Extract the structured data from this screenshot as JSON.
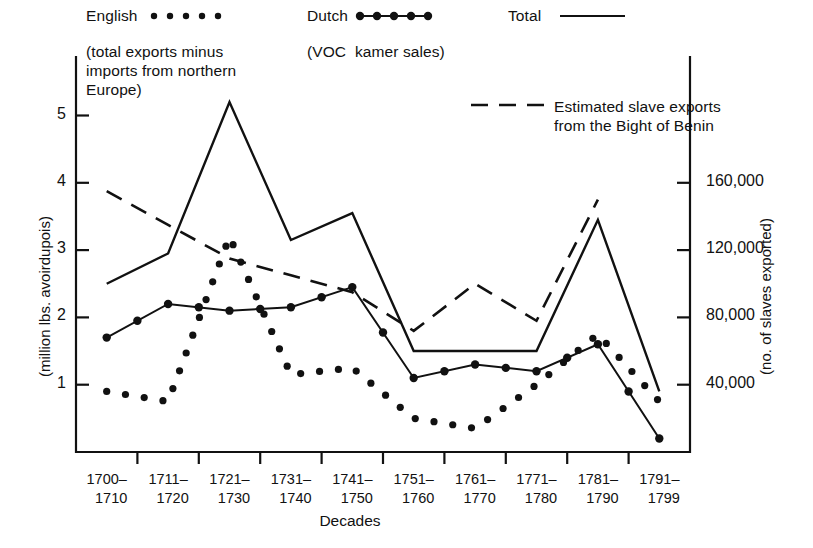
{
  "chart_data": {
    "type": "line",
    "title": "",
    "xlabel": "Decades",
    "ylabel": "(million lbs. avoirdupois)",
    "ylabel_right": "(no. of slaves exported)",
    "categories": [
      "1700–1710",
      "1711–1720",
      "1721–1730",
      "1731–1740",
      "1741–1750",
      "1751–1760",
      "1761–1770",
      "1771–1780",
      "1781–1790",
      "1791–1799"
    ],
    "ylim": [
      0,
      5.6
    ],
    "yticks": [
      1,
      2,
      3,
      4,
      5
    ],
    "ylim_right": [
      0,
      224000
    ],
    "yticks_right": [
      40000,
      80000,
      120000,
      160000
    ],
    "ytick_labels_right": [
      "40,000",
      "80,000",
      "120,000",
      "160,000"
    ],
    "grid": false,
    "legend_position": "top",
    "series": [
      {
        "name": "English",
        "style": "dotted",
        "axis": "left",
        "values": [
          0.9,
          0.75,
          3.2,
          1.15,
          1.25,
          0.5,
          0.35,
          1.0,
          1.75,
          0.75
        ]
      },
      {
        "name": "Dutch",
        "style": "line-markers",
        "axis": "left",
        "values": [
          1.7,
          2.2,
          2.1,
          2.15,
          2.45,
          1.1,
          1.3,
          1.2,
          1.6,
          0.2
        ]
      },
      {
        "name": "Total",
        "style": "solid",
        "axis": "left",
        "values": [
          2.5,
          2.95,
          5.2,
          3.15,
          3.55,
          1.5,
          1.5,
          1.5,
          3.45,
          0.9
        ]
      },
      {
        "name": "Estimated slave exports from the Bight of Benin",
        "style": "dashed",
        "axis": "right",
        "values": [
          155000,
          135000,
          115000,
          105000,
          95000,
          72000,
          100000,
          78000,
          150000,
          null
        ]
      }
    ]
  },
  "legend": {
    "english_label": "English",
    "english_sub": "(total exports minus\nimports from northern\nEurope)",
    "dutch_label": "Dutch",
    "dutch_sub": "(VOC  kamer sales)",
    "total_label": "Total",
    "slave_label": "Estimated slave exports",
    "slave_label2": "from the Bight of Benin"
  },
  "axes": {
    "y_left_title": "(million lbs. avoirdupois)",
    "y_right_title": "(no. of slaves exported)",
    "x_title": "Decades",
    "y_left_ticks": [
      "1",
      "2",
      "3",
      "4",
      "5"
    ],
    "y_right_ticks": [
      "40,000",
      "80,000",
      "120,000",
      "160,000"
    ],
    "x_ticks": [
      {
        "top": "1700–",
        "bottom": "1710"
      },
      {
        "top": "1711–",
        "bottom": "1720"
      },
      {
        "top": "1721–",
        "bottom": "1730"
      },
      {
        "top": "1731–",
        "bottom": "1740"
      },
      {
        "top": "1741–",
        "bottom": "1750"
      },
      {
        "top": "1751–",
        "bottom": "1760"
      },
      {
        "top": "1761–",
        "bottom": "1770"
      },
      {
        "top": "1771–",
        "bottom": "1780"
      },
      {
        "top": "1781–",
        "bottom": "1790"
      },
      {
        "top": "1791–",
        "bottom": "1799"
      }
    ]
  },
  "colors": {
    "ink": "#111111",
    "background": "#ffffff"
  }
}
